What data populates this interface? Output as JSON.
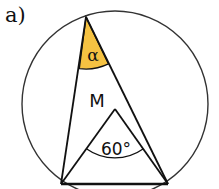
{
  "figure": {
    "label": "a)",
    "circle": {
      "cx": 115,
      "cy": 104,
      "r": 93
    },
    "points": {
      "apex": {
        "x": 86,
        "y": 17
      },
      "left": {
        "x": 61,
        "y": 184
      },
      "right": {
        "x": 168,
        "y": 184
      },
      "center": {
        "x": 115,
        "y": 109
      }
    },
    "labels": {
      "center_label": "M",
      "inscribed_angle": "α",
      "central_angle": "60°"
    },
    "colors": {
      "angle_fill": "#F5C242",
      "stroke": "#111111"
    }
  }
}
